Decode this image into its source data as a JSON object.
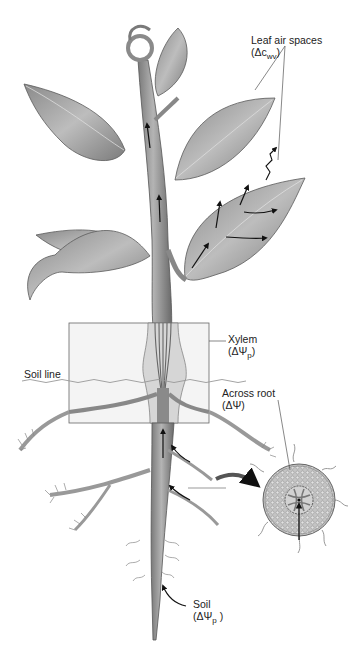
{
  "figure": {
    "style": "grayscale illustration"
  },
  "labels": {
    "leaf_air_spaces": {
      "name": "Leaf air spaces",
      "symbol_prefix": "(Δc",
      "symbol_sub": "wv",
      "symbol_suffix": ")"
    },
    "xylem": {
      "name": "Xylem",
      "symbol_prefix": "(ΔΨ",
      "symbol_sub": "p",
      "symbol_suffix": ")"
    },
    "soil_line": {
      "name": "Soil line"
    },
    "across_root": {
      "name": "Across root",
      "symbol": "(ΔΨ)"
    },
    "soil": {
      "name": "Soil",
      "symbol_prefix": "(ΔΨ",
      "symbol_sub": "p",
      "symbol_suffix": " )"
    }
  },
  "colors": {
    "background": "#ffffff",
    "stem": "#9a9a9a",
    "stem_dark": "#6f6f6f",
    "leaf": "#a8a8a8",
    "leaf_dark": "#707070",
    "arrow": "#111111",
    "inset_box": "#eeeeee",
    "leader_line": "#444444",
    "root_section": "#bdbdbd"
  }
}
